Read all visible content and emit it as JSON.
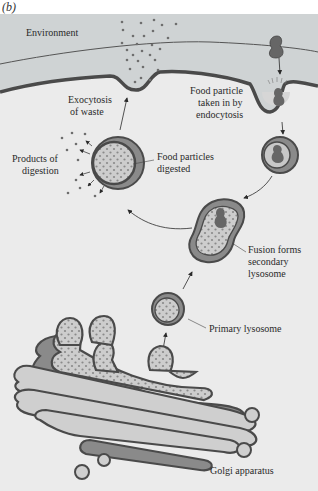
{
  "figure": {
    "panel_label": "(b)",
    "colors": {
      "background": "#e9e9e9",
      "environment": "#cfd3d4",
      "cell_interior": "#ebebeb",
      "membrane_dark": "#4a4a4a",
      "membrane_mid": "#8a8a8a",
      "lumen": "#c6c6c6",
      "particle": "#6e6e6e",
      "text": "#2a2a2a"
    },
    "labels": {
      "environment": "Environment",
      "exocytosis_1": "Exocytosis",
      "exocytosis_2": "of waste",
      "endocytosis_1": "Food particle",
      "endocytosis_2": "taken in by",
      "endocytosis_3": "endocytosis",
      "products_1": "Products of",
      "products_2": "digestion",
      "digested_1": "Food particles",
      "digested_2": "digested",
      "fusion_1": "Fusion forms",
      "fusion_2": "secondary",
      "fusion_3": "lysosome",
      "primary": "Primary lysosome",
      "golgi": "Golgi apparatus"
    }
  }
}
